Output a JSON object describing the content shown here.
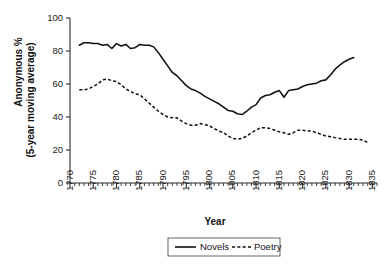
{
  "chart_data": {
    "type": "line",
    "title": "",
    "xlabel": "Year",
    "ylabel": "Anonymous %\n(5-year moving average)",
    "ylabel_line1": "Anonymous %",
    "ylabel_line2": "(5-year moving average)",
    "xlim": [
      1770,
      1836
    ],
    "ylim": [
      0,
      100
    ],
    "ytick_values": [
      0,
      20,
      40,
      60,
      80,
      100
    ],
    "ytick_labels": [
      "0",
      "20",
      "40",
      "60",
      "80",
      "100"
    ],
    "xtick_values": [
      1770,
      1775,
      1780,
      1785,
      1790,
      1795,
      1800,
      1805,
      1810,
      1815,
      1820,
      1825,
      1830,
      1835
    ],
    "xtick_labels": [
      "1770",
      "1775",
      "1780",
      "1785",
      "1790",
      "1795",
      "1800",
      "1805",
      "1810",
      "1815",
      "1820",
      "1825",
      "1830",
      "1835"
    ],
    "xtick_minor_step": 1,
    "grid": false,
    "legend_position": "below-center",
    "legend_entries": [
      {
        "name": "Novels",
        "style": "solid"
      },
      {
        "name": "Poetry",
        "style": "dashed"
      }
    ],
    "series": [
      {
        "name": "Novels",
        "style": "solid",
        "color": "#111111",
        "x": [
          1772,
          1773,
          1774,
          1775,
          1776,
          1777,
          1778,
          1779,
          1780,
          1781,
          1782,
          1783,
          1784,
          1785,
          1786,
          1787,
          1788,
          1789,
          1790,
          1791,
          1792,
          1793,
          1794,
          1795,
          1796,
          1797,
          1798,
          1799,
          1800,
          1801,
          1802,
          1803,
          1804,
          1805,
          1806,
          1807,
          1808,
          1809,
          1810,
          1811,
          1812,
          1813,
          1814,
          1815,
          1816,
          1817,
          1818,
          1819,
          1820,
          1821,
          1822,
          1823,
          1824,
          1825,
          1826,
          1827,
          1828,
          1829,
          1830,
          1831
        ],
        "values": [
          83.5,
          85.0,
          85.0,
          84.5,
          84.5,
          83.5,
          84.0,
          81.5,
          84.5,
          83.0,
          84.0,
          81.5,
          82.0,
          84.0,
          83.5,
          83.5,
          82.5,
          79.0,
          75.0,
          71.0,
          67.0,
          65.0,
          62.0,
          59.0,
          57.0,
          56.0,
          54.5,
          52.5,
          51.0,
          49.5,
          48.0,
          46.0,
          44.0,
          43.5,
          42.0,
          41.5,
          43.5,
          46.0,
          47.5,
          51.5,
          53.0,
          53.5,
          55.0,
          56.0,
          52.0,
          56.0,
          56.5,
          57.0,
          58.5,
          59.5,
          60.0,
          60.5,
          62.0,
          62.5,
          65.5,
          69.0,
          71.5,
          73.5,
          75.0,
          76.0
        ]
      },
      {
        "name": "Poetry",
        "style": "dashed",
        "color": "#111111",
        "x": [
          1772,
          1773,
          1774,
          1775,
          1776,
          1777,
          1778,
          1779,
          1780,
          1781,
          1782,
          1783,
          1784,
          1785,
          1786,
          1787,
          1788,
          1789,
          1790,
          1791,
          1792,
          1793,
          1794,
          1795,
          1796,
          1797,
          1798,
          1799,
          1800,
          1801,
          1802,
          1803,
          1804,
          1805,
          1806,
          1807,
          1808,
          1809,
          1810,
          1811,
          1812,
          1813,
          1814,
          1815,
          1816,
          1817,
          1818,
          1819,
          1820,
          1821,
          1822,
          1823,
          1824,
          1825,
          1826,
          1827,
          1828,
          1829,
          1830,
          1831,
          1832,
          1833,
          1834
        ],
        "values": [
          56.5,
          56.5,
          57.0,
          58.5,
          60.0,
          62.5,
          63.0,
          62.0,
          61.5,
          59.5,
          57.0,
          55.5,
          54.0,
          53.5,
          51.0,
          48.5,
          46.0,
          43.5,
          41.5,
          40.0,
          39.5,
          39.5,
          37.5,
          36.0,
          35.0,
          35.0,
          36.0,
          35.5,
          34.5,
          33.0,
          31.5,
          30.5,
          28.5,
          27.0,
          26.5,
          27.0,
          28.5,
          30.5,
          32.0,
          33.5,
          33.5,
          33.0,
          32.0,
          31.0,
          30.5,
          29.5,
          30.5,
          32.0,
          32.0,
          31.5,
          31.5,
          30.5,
          29.5,
          28.5,
          28.0,
          27.5,
          27.0,
          26.5,
          26.5,
          26.5,
          26.5,
          26.0,
          24.5
        ]
      }
    ]
  },
  "axis": {
    "x_title": "Year",
    "y_title_line1": "Anonymous %",
    "y_title_line2": "(5-year moving average)"
  },
  "legend": {
    "novels_label": "Novels",
    "poetry_label": "Poetry"
  },
  "colors": {
    "line": "#111111",
    "axis": "#2b2b2b",
    "background": "#ffffff"
  }
}
